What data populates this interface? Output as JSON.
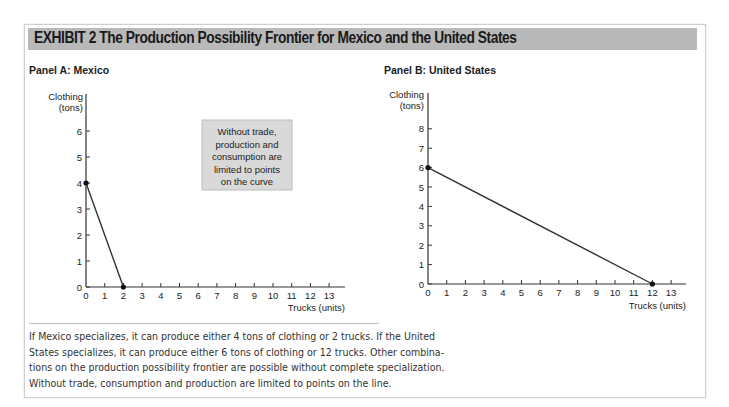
{
  "exhibit": {
    "title": "EXHIBIT 2  The Production Possibility Frontier for Mexico and the United States"
  },
  "panels": {
    "a": {
      "title": "Panel A: Mexico",
      "ylabel_1": "Clothing",
      "ylabel_2": "(tons)",
      "xlabel": "Trucks (units)"
    },
    "b": {
      "title": "Panel B: United States",
      "ylabel_1": "Clothing",
      "ylabel_2": "(tons)",
      "xlabel": "Trucks (units)"
    }
  },
  "annotation": {
    "lines": [
      "Without trade,",
      "production and",
      "consumption are",
      "limited to points",
      "on the curve"
    ]
  },
  "caption": {
    "lines": [
      "If Mexico specializes, it can produce either 4 tons of clothing or 2 trucks. If the United",
      "States specializes, it can produce either 6 tons of clothing or 12 trucks. Other combina-",
      "tions on the production possibility frontier are possible without complete specialization.",
      "Without trade, consumption and production are limited to points on the line."
    ]
  },
  "colors": {
    "banner": "#b9b9b9",
    "annotation_bg": "#d9d9d9",
    "line": "#333333"
  },
  "chart_data": [
    {
      "type": "line",
      "title": "Panel A: Mexico",
      "xlabel": "Trucks (units)",
      "ylabel": "Clothing (tons)",
      "x": [
        0,
        2
      ],
      "series": [
        {
          "name": "Mexico PPF",
          "values": [
            4,
            0
          ]
        }
      ],
      "points": [
        {
          "x": 0,
          "y": 4
        },
        {
          "x": 2,
          "y": 0
        }
      ],
      "xlim": [
        0,
        13.5
      ],
      "ylim": [
        0,
        6.8
      ],
      "xticks": [
        0,
        1,
        2,
        3,
        4,
        5,
        6,
        7,
        8,
        9,
        10,
        11,
        12,
        13
      ],
      "yticks": [
        0,
        1,
        2,
        3,
        4,
        5,
        6
      ],
      "grid": false,
      "annotations": [
        "Without trade, production and consumption are limited to points on the curve"
      ]
    },
    {
      "type": "line",
      "title": "Panel B: United States",
      "xlabel": "Trucks (units)",
      "ylabel": "Clothing (tons)",
      "x": [
        0,
        12
      ],
      "series": [
        {
          "name": "United States PPF",
          "values": [
            6,
            0
          ]
        }
      ],
      "points": [
        {
          "x": 0,
          "y": 6
        },
        {
          "x": 12,
          "y": 0
        }
      ],
      "xlim": [
        0,
        13.5
      ],
      "ylim": [
        0,
        9.5
      ],
      "xticks": [
        0,
        1,
        2,
        3,
        4,
        5,
        6,
        7,
        8,
        9,
        10,
        11,
        12,
        13
      ],
      "yticks": [
        0,
        1,
        2,
        3,
        4,
        5,
        6,
        7,
        8
      ],
      "grid": false
    }
  ]
}
